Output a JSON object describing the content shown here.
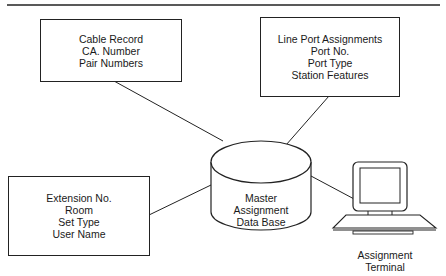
{
  "diagram": {
    "type": "data-flow",
    "boxes": [
      {
        "id": "cable-record",
        "lines": [
          "Cable Record",
          "CA. Number",
          "Pair Numbers"
        ]
      },
      {
        "id": "line-port",
        "lines": [
          "Line Port Assignments",
          "Port No.",
          "Port Type",
          "Station Features"
        ]
      },
      {
        "id": "extension",
        "lines": [
          "Extension No.",
          "Room",
          "Set Type",
          "User Name"
        ]
      }
    ],
    "database": {
      "lines": [
        "Master",
        "Assignment",
        "Data Base"
      ]
    },
    "terminal": {
      "lines": [
        "Assignment",
        "Terminal"
      ]
    },
    "connections": [
      [
        "cable-record",
        "database"
      ],
      [
        "line-port",
        "database"
      ],
      [
        "extension",
        "database"
      ],
      [
        "database",
        "terminal"
      ]
    ]
  }
}
